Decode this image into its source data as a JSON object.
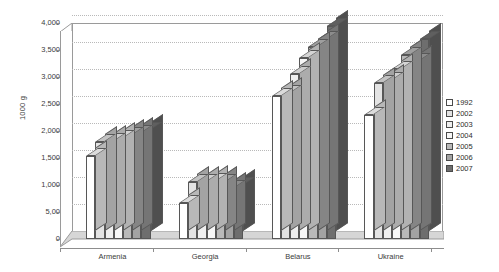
{
  "chart_data": {
    "type": "bar",
    "title": "",
    "subtitle": "",
    "xlabel": "",
    "ylabel": "1000 g",
    "categories": [
      "Armenia",
      "Georgia",
      "Belarus",
      "Ukraine"
    ],
    "ylim": [
      0,
      4000
    ],
    "yticks": [
      0,
      500,
      1000,
      1500,
      2000,
      2500,
      3000,
      3500,
      4000
    ],
    "ytick_labels": [
      "0",
      "5,00",
      "1,000",
      "1,500",
      "2,000",
      "2,500",
      "3,000",
      "3,500",
      "4,000"
    ],
    "grid": true,
    "legend_position": "right",
    "style": "3d-clustered-column",
    "series": [
      {
        "name": "1992",
        "color": "#ffffff",
        "values": [
          1540,
          660,
          2650,
          2300
        ]
      },
      {
        "name": "2002",
        "color": "#e3e3e3",
        "values": [
          1800,
          1060,
          2700,
          2880
        ]
      },
      {
        "name": "2003",
        "color": "#efefef",
        "values": [
          1820,
          1060,
          3050,
          2950
        ]
      },
      {
        "name": "2004",
        "color": "#f7f7f7",
        "values": [
          1870,
          1070,
          3350,
          3150
        ]
      },
      {
        "name": "2005",
        "color": "#b9b9b9",
        "values": [
          1930,
          1060,
          3550,
          3400
        ]
      },
      {
        "name": "2006",
        "color": "#a3a3a3",
        "values": [
          1960,
          950,
          3700,
          3300
        ]
      },
      {
        "name": "2007",
        "color": "#6e6e6e",
        "values": [
          2010,
          1000,
          3950,
          3700
        ]
      }
    ]
  },
  "legend": {
    "items": [
      {
        "label": "1992"
      },
      {
        "label": "2002"
      },
      {
        "label": "2003"
      },
      {
        "label": "2004"
      },
      {
        "label": "2005"
      },
      {
        "label": "2006"
      },
      {
        "label": "2007"
      }
    ]
  },
  "axes": {
    "y_title": "1000 g",
    "y_labels": [
      "4,000",
      "3,500",
      "3,000",
      "2,500",
      "2,000",
      "1,500",
      "1,000",
      "5,00",
      "0"
    ],
    "x_labels": [
      "Armenia",
      "Georgia",
      "Belarus",
      "Ukraine"
    ]
  },
  "colors": {
    "frame": "#9a9a9a",
    "grid": "#b9b9b9",
    "floor": "#d6d6d6",
    "text": "#3b3b3b",
    "bar_outline": "#575757"
  }
}
